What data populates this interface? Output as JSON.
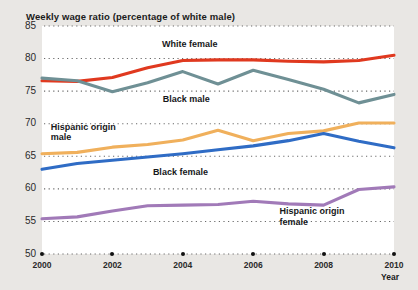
{
  "chart_data": {
    "type": "line",
    "title": "Weekly wage ratio (percentage of white male)",
    "xlabel": "Year",
    "ylabel": "",
    "xlim": [
      2000,
      2010
    ],
    "ylim": [
      50,
      85
    ],
    "yticks": [
      85,
      80,
      75,
      70,
      65,
      60,
      55,
      50
    ],
    "xticks": [
      2000,
      2002,
      2004,
      2006,
      2008,
      2010
    ],
    "grid": "horizontal-dotted",
    "legend": "inline-annotations",
    "x": [
      2000,
      2001,
      2002,
      2003,
      2004,
      2005,
      2006,
      2007,
      2008,
      2009,
      2010
    ],
    "series": [
      {
        "name": "White female",
        "color": "#e0391f",
        "values": [
          76.6,
          76.5,
          77.1,
          78.6,
          79.7,
          79.8,
          79.8,
          79.6,
          79.5,
          79.7,
          80.5
        ]
      },
      {
        "name": "Black male",
        "color": "#6f9095",
        "values": [
          77.0,
          76.6,
          74.9,
          76.3,
          78.0,
          76.1,
          78.2,
          76.8,
          75.3,
          73.2,
          74.5
        ]
      },
      {
        "name": "Hispanic origin male",
        "color": "#f0b05c",
        "values": [
          65.4,
          65.6,
          66.4,
          66.8,
          67.5,
          69.0,
          67.4,
          68.5,
          68.9,
          70.1,
          70.1
        ]
      },
      {
        "name": "Black female",
        "color": "#2f6cc5",
        "values": [
          63.0,
          63.9,
          64.4,
          64.9,
          65.4,
          66.0,
          66.6,
          67.4,
          68.5,
          67.3,
          66.3
        ]
      },
      {
        "name": "Hispanic origin female",
        "color": "#a17ab8",
        "values": [
          55.4,
          55.7,
          56.6,
          57.4,
          57.5,
          57.6,
          58.1,
          57.7,
          57.5,
          59.9,
          60.3
        ]
      }
    ],
    "annotations": [
      {
        "text": "White female",
        "x": 2004.2,
        "y": 82.1,
        "align": "center"
      },
      {
        "text": "Black male",
        "x": 2004.1,
        "y": 73.6,
        "align": "center"
      },
      {
        "text": "Hispanic origin\nmale",
        "x": 2000.25,
        "y": 69.4,
        "align": "left"
      },
      {
        "text": "Black female",
        "x": 2003.15,
        "y": 62.5,
        "align": "left"
      },
      {
        "text": "Hispanic origin\nfemale",
        "x": 2006.75,
        "y": 56.4,
        "align": "left"
      }
    ]
  }
}
